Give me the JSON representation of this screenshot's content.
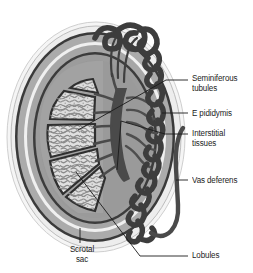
{
  "figure": {
    "background_color": "#ffffff",
    "width": 253,
    "height": 273
  },
  "labels": [
    {
      "id": "seminiferous-tubules",
      "text": "Seminiferous\ntubules",
      "lines": [
        "Seminiferous",
        "tubules"
      ],
      "x": 192,
      "y": 74
    },
    {
      "id": "epididymis",
      "text": "E pididymis",
      "lines": [
        "E pididymis"
      ],
      "x": 192,
      "y": 109
    },
    {
      "id": "interstitial-tissues",
      "text": "Interstitial\ntissues",
      "lines": [
        "Interstitial",
        "tissues"
      ],
      "x": 192,
      "y": 129
    },
    {
      "id": "vas-deferens",
      "text": "Vas deferens",
      "lines": [
        "Vas deferens"
      ],
      "x": 192,
      "y": 176
    },
    {
      "id": "lobules",
      "text": "Lobules",
      "lines": [
        "Lobules"
      ],
      "x": 192,
      "y": 251
    },
    {
      "id": "scrotal-sac",
      "text": "Scrotal\nsac",
      "lines": [
        "Scrotal",
        "sac"
      ],
      "x": 62,
      "y": 245
    }
  ],
  "label_text": {
    "seminiferous_tubules": "Seminiferous\ntubules",
    "epididymis": "E pididymis",
    "interstitial_tissues": "Interstitial\ntissues",
    "vas_deferens": "Vas deferens",
    "lobules": "Lobules",
    "scrotal_sac": "Scrotal\nsac"
  },
  "colors": {
    "background": "#ffffff",
    "outline_dark": "#2b2b2b",
    "scrotal_outer_light": "#efefef",
    "scrotal_mid_gray": "#a8a8a8",
    "scrotal_inner_gray": "#8f8f8f",
    "tunica_dark": "#3a3a3a",
    "testis_body_gray": "#9a9a9a",
    "lobule_fill_light": "#d8d8d8",
    "lobule_fill_lighter": "#e2e2e2",
    "epididymis_dark": "#444444",
    "vas_deferens_dark": "#4a4a4a",
    "rete_dark": "#4d4d4d",
    "leader_line": "#1b1b1b",
    "text": "#1b1b1b"
  },
  "structures": [
    {
      "name": "scrotal-sac-outer-wall",
      "description": "outermost pale layer of scrotal sac"
    },
    {
      "name": "scrotal-sac-mid-wall",
      "description": "mid gray muscular layer"
    },
    {
      "name": "tunica-vaginalis",
      "description": "dark inner boundary line"
    },
    {
      "name": "testis-body",
      "description": "gray oval body of the testis"
    },
    {
      "name": "lobules",
      "description": "wedge-shaped segments containing seminiferous tubules"
    },
    {
      "name": "seminiferous-tubules",
      "description": "coiled tubules filling each lobule"
    },
    {
      "name": "rete-testis",
      "description": "dark branching network at the hilum"
    },
    {
      "name": "efferent-ductules",
      "description": "ducts connecting rete testis to epididymis"
    },
    {
      "name": "epididymis",
      "description": "dark coiled tube along the posterior testis"
    },
    {
      "name": "vas-deferens",
      "description": "smooth tube ascending from the epididymis tail"
    }
  ]
}
